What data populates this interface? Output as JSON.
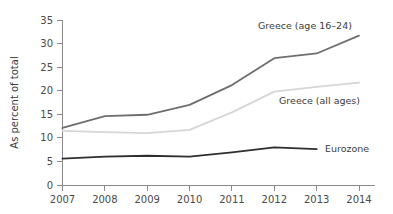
{
  "chart_data": {
    "type": "line",
    "title": "",
    "subtitle": "",
    "xlabel": "",
    "ylabel": "As percent of total",
    "x": [
      2007,
      2008,
      2009,
      2010,
      2011,
      2012,
      2013,
      2014
    ],
    "categories": [
      "2007",
      "2008",
      "2009",
      "2010",
      "2011",
      "2012",
      "2013",
      "2014"
    ],
    "xlim": [
      2007,
      2014
    ],
    "ylim": [
      0,
      35
    ],
    "yticks": [
      0,
      5,
      10,
      15,
      20,
      25,
      30,
      35
    ],
    "ytick_labels": [
      "0",
      "5",
      "10",
      "15",
      "20",
      "25",
      "30",
      "35"
    ],
    "xtick_labels": [
      "2007",
      "2008",
      "2009",
      "2010",
      "2011",
      "2012",
      "2013",
      "2014"
    ],
    "grid": false,
    "legend_position": "inline-right",
    "series": [
      {
        "name": "Greece (age 16–24)",
        "color": "#6e6e6e",
        "values": [
          12.1,
          14.6,
          14.9,
          17.0,
          21.2,
          26.9,
          27.9,
          31.7
        ]
      },
      {
        "name": "Greece (all ages)",
        "color": "#d6d6d6",
        "values": [
          11.5,
          11.2,
          11.0,
          11.7,
          15.4,
          19.8,
          20.8,
          21.7
        ]
      },
      {
        "name": "Eurozone",
        "color": "#2e2e2e",
        "values": [
          5.6,
          6.0,
          6.2,
          6.0,
          6.9,
          8.0,
          7.6,
          null
        ]
      }
    ],
    "annotations": [
      {
        "text": "Greece (age 16–24)",
        "series": 0
      },
      {
        "text": "Greece (all ages)",
        "series": 1
      },
      {
        "text": "Eurozone",
        "series": 2
      }
    ]
  },
  "colors": {
    "axis": "#8a8a8a",
    "tick_text": "#4a4a4a",
    "axis_title": "#3c3c3c",
    "background": "#ffffff"
  }
}
